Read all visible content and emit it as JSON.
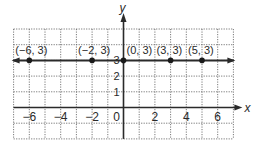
{
  "chart_data": {
    "type": "scatter",
    "title": "",
    "xlabel": "x",
    "ylabel": "y",
    "xlim": [
      -7,
      7
    ],
    "ylim": [
      -2,
      5
    ],
    "grid": true,
    "grid_style": "dotted",
    "x_ticks": [
      -6,
      -4,
      -2,
      0,
      2,
      4,
      6
    ],
    "x_tick_labels": [
      "−6",
      "−4",
      "−2",
      "0",
      "2",
      "4",
      "6"
    ],
    "y_ticks": [
      1,
      2,
      3
    ],
    "y_tick_labels": [
      "1",
      "2",
      "3"
    ],
    "line": {
      "equation": "y = 3",
      "y": 3,
      "arrows": "both"
    },
    "series": [
      {
        "name": "points on y = 3",
        "x": [
          -6,
          -2,
          0,
          3,
          5
        ],
        "y": [
          3,
          3,
          3,
          3,
          3
        ]
      }
    ],
    "annotations": [
      "(−6, 3)",
      "(−2, 3)",
      "(0, 3)",
      "(3, 3)",
      "(5, 3)"
    ],
    "colors": {
      "line": "#2a2a2a",
      "grid": "#6a6a6a",
      "points": "#1a1a1a"
    }
  }
}
